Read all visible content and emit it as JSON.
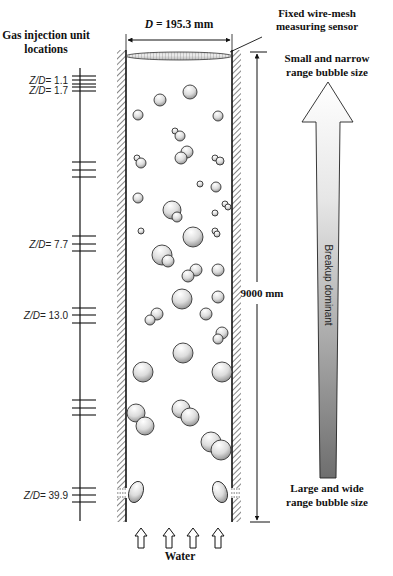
{
  "left_axis": {
    "title_line1": "Gas injection unit",
    "title_line2": "locations",
    "labels": [
      {
        "prefix": "Z/D",
        "value": "= 1.1",
        "y": 80
      },
      {
        "prefix": "Z/D",
        "value": "= 1.7",
        "y": 90
      },
      {
        "prefix": "Z/D",
        "value": "= 7.7",
        "y": 244
      },
      {
        "prefix": "Z/D",
        "value": "= 13.0",
        "y": 315
      },
      {
        "prefix": "Z/D",
        "value": "= 39.9",
        "y": 495
      }
    ],
    "tick_groups_y": [
      [
        76,
        80,
        84
      ],
      [
        87,
        91
      ],
      [
        162,
        170,
        177
      ],
      [
        236,
        244,
        251
      ],
      [
        308,
        315,
        323
      ],
      [
        400,
        408,
        415
      ],
      [
        488,
        495,
        502
      ]
    ]
  },
  "column": {
    "diameter_label": "D = 195.3 mm",
    "diameter_prefix": "D",
    "diameter_value": " = 195.3 mm",
    "height_label": "9000 mm",
    "sensor_label_line1": "Fixed wire-mesh",
    "sensor_label_line2": "measuring sensor",
    "inlet_label": "Water"
  },
  "trend_arrow": {
    "top_label_line1": "Small and narrow",
    "top_label_line2": "range bubble size",
    "middle_label": "Breakup dominant",
    "bottom_label_line1": "Large and wide",
    "bottom_label_line2": "range bubble size",
    "gradient_top": "#ffffff",
    "gradient_bottom": "#777777"
  },
  "bubbles": [
    {
      "cx": 160,
      "cy": 100,
      "r": 6
    },
    {
      "cx": 190,
      "cy": 92,
      "r": 7
    },
    {
      "cx": 138,
      "cy": 115,
      "r": 5
    },
    {
      "cx": 218,
      "cy": 116,
      "r": 5
    },
    {
      "cx": 175,
      "cy": 131,
      "r": 3
    },
    {
      "cx": 180,
      "cy": 136,
      "r": 5
    },
    {
      "cx": 137,
      "cy": 158,
      "r": 3
    },
    {
      "cx": 141,
      "cy": 163,
      "r": 5
    },
    {
      "cx": 187,
      "cy": 152,
      "r": 6
    },
    {
      "cx": 181,
      "cy": 158,
      "r": 6
    },
    {
      "cx": 215,
      "cy": 158,
      "r": 3
    },
    {
      "cx": 220,
      "cy": 161,
      "r": 4
    },
    {
      "cx": 200,
      "cy": 184,
      "r": 3
    },
    {
      "cx": 216,
      "cy": 187,
      "r": 5
    },
    {
      "cx": 138,
      "cy": 198,
      "r": 5
    },
    {
      "cx": 172,
      "cy": 210,
      "r": 9
    },
    {
      "cx": 177,
      "cy": 217,
      "r": 5
    },
    {
      "cx": 225,
      "cy": 204,
      "r": 3
    },
    {
      "cx": 228,
      "cy": 207,
      "r": 3
    },
    {
      "cx": 215,
      "cy": 213,
      "r": 3
    },
    {
      "cx": 141,
      "cy": 231,
      "r": 3
    },
    {
      "cx": 193,
      "cy": 237,
      "r": 10
    },
    {
      "cx": 215,
      "cy": 231,
      "r": 3
    },
    {
      "cx": 217,
      "cy": 234,
      "r": 3
    },
    {
      "cx": 162,
      "cy": 255,
      "r": 10
    },
    {
      "cx": 168,
      "cy": 261,
      "r": 6
    },
    {
      "cx": 196,
      "cy": 270,
      "r": 6
    },
    {
      "cx": 188,
      "cy": 276,
      "r": 6
    },
    {
      "cx": 218,
      "cy": 270,
      "r": 6
    },
    {
      "cx": 182,
      "cy": 299,
      "r": 10
    },
    {
      "cx": 218,
      "cy": 297,
      "r": 6
    },
    {
      "cx": 157,
      "cy": 314,
      "r": 6
    },
    {
      "cx": 150,
      "cy": 320,
      "r": 5
    },
    {
      "cx": 206,
      "cy": 314,
      "r": 6
    },
    {
      "cx": 222,
      "cy": 333,
      "r": 6
    },
    {
      "cx": 218,
      "cy": 339,
      "r": 5
    },
    {
      "cx": 183,
      "cy": 353,
      "r": 10
    },
    {
      "cx": 143,
      "cy": 372,
      "r": 10
    },
    {
      "cx": 222,
      "cy": 372,
      "r": 10
    },
    {
      "cx": 136,
      "cy": 413,
      "r": 9
    },
    {
      "cx": 145,
      "cy": 426,
      "r": 9
    },
    {
      "cx": 181,
      "cy": 409,
      "r": 9
    },
    {
      "cx": 190,
      "cy": 417,
      "r": 9
    },
    {
      "cx": 211,
      "cy": 442,
      "r": 10
    },
    {
      "cx": 221,
      "cy": 450,
      "r": 10
    }
  ],
  "injector_bubbles": [
    {
      "cx": 136,
      "cy": 492,
      "rx": 7,
      "ry": 11,
      "rot": 20
    },
    {
      "cx": 220,
      "cy": 492,
      "rx": 7,
      "ry": 11,
      "rot": -20
    }
  ],
  "water_arrows_x": [
    141,
    169,
    193,
    218
  ]
}
